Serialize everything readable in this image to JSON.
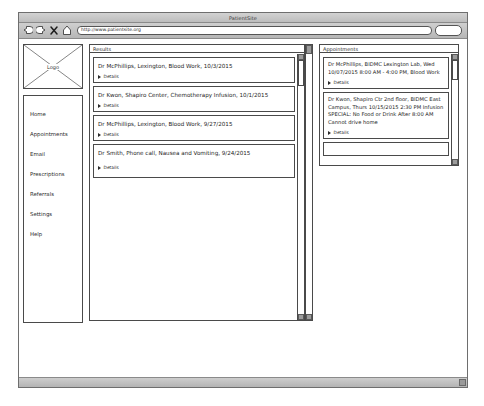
{
  "browser": {
    "title": "PatientSite",
    "url": "http://www.patientsite.org",
    "nav": {
      "back_icon": "back-arrow-icon",
      "forward_icon": "forward-arrow-icon",
      "stop_icon": "stop-x-icon",
      "home_icon": "home-icon"
    },
    "search_placeholder": ""
  },
  "sidebar": {
    "logo_caption": "Logo",
    "items": [
      {
        "label": "Home"
      },
      {
        "label": "Appointments"
      },
      {
        "label": "Email"
      },
      {
        "label": "Prescriptions"
      },
      {
        "label": "Referrals"
      },
      {
        "label": "Settings"
      },
      {
        "label": "Help"
      }
    ]
  },
  "results": {
    "header": "Results",
    "details_label": "Details",
    "cards": [
      {
        "title": "Dr McPhillips, Lexington, Blood Work, 10/3/2015",
        "details": "Details"
      },
      {
        "title": "Dr Kwon, Shapiro Center, Chemotherapy Infusion, 10/1/2015",
        "details": "Details"
      },
      {
        "title": "Dr McPhillips, Lexington, Blood Work, 9/27/2015",
        "details": "Details"
      },
      {
        "title": "Dr Smith, Phone call, Nausea and Vomiting, 9/24/2015",
        "details": "Details"
      }
    ]
  },
  "appointments": {
    "header": "Appointments",
    "details_label": "Details",
    "cards": [
      {
        "lines": [
          "Dr McPhillips, BIDMC Lexington Lab,  Wed",
          "10/07/2015  8:00 AM - 4:00 PM,  Blood Work"
        ],
        "details": "Details"
      },
      {
        "lines": [
          "Dr Kwon, Shapiro Ctr 2nd floor, BIDMC East",
          "Campus, Thurs 10/15/2015  2:30 PM  Infusion",
          "SPECIAL: No Food or Drink After 8:00 AM",
          "Cannot drive home"
        ],
        "details": "Details"
      }
    ]
  },
  "colors": {
    "frame": "#4a4a4a",
    "chrome": "#c6c6c6",
    "text": "#1d1d1d",
    "page_bg": "#ffffff"
  }
}
